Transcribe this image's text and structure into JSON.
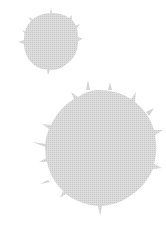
{
  "canvas": {
    "width": 166,
    "height": 230,
    "background": "#ffffff"
  },
  "splats": [
    {
      "name": "small-splat",
      "cx": 50,
      "cy": 39,
      "r": 27,
      "color": "#d4d4d4"
    },
    {
      "name": "large-splat",
      "cx": 98,
      "cy": 148,
      "r": 57,
      "color": "#d4d4d4"
    }
  ]
}
